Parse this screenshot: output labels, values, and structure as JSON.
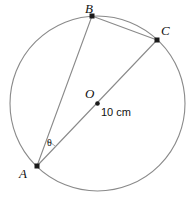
{
  "figure": {
    "type": "circle-geometry-diagram",
    "background_color": "#ffffff",
    "stroke_color": "#8a8a8a",
    "label_color": "#111111",
    "width": 189,
    "height": 201
  },
  "circle": {
    "name": "main-circle",
    "center_x": 97.5,
    "center_y": 103.5,
    "radius": 87.5,
    "radius_label": "10 cm"
  },
  "points": [
    {
      "id": "A",
      "label": "A",
      "x": 37,
      "y": 166,
      "label_x": 19,
      "label_y": 178
    },
    {
      "id": "B",
      "label": "B",
      "x": 92,
      "y": 16,
      "label_x": 85,
      "label_y": 13
    },
    {
      "id": "C",
      "label": "C",
      "x": 157,
      "y": 40,
      "label_x": 161,
      "label_y": 35
    },
    {
      "id": "O",
      "label": "O",
      "x": 97.5,
      "y": 103.5,
      "label_x": 85,
      "label_y": 98
    }
  ],
  "segments": [
    {
      "name": "chord-a-b",
      "from": "A",
      "to": "B"
    },
    {
      "name": "chord-b-c",
      "from": "B",
      "to": "C"
    },
    {
      "name": "diameter-a-c",
      "from": "A",
      "to": "C"
    }
  ],
  "angle": {
    "name": "angle-theta-at-a",
    "symbol": "θ",
    "vertex": "A",
    "label_x": 47,
    "label_y": 146,
    "arc_radius": 27
  },
  "measure": {
    "text": "10 cm",
    "x": 101,
    "y": 116
  }
}
